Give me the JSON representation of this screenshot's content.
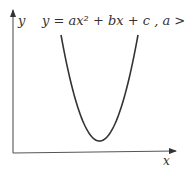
{
  "diagram": {
    "equation": "y = ax² + bx + c , a > 0",
    "y_axis_label": "y",
    "x_axis_label": "x",
    "curve": {
      "type": "parabola",
      "opens": "upward",
      "vertex_x_fraction": 0.5
    },
    "stroke_color": "#333333"
  }
}
